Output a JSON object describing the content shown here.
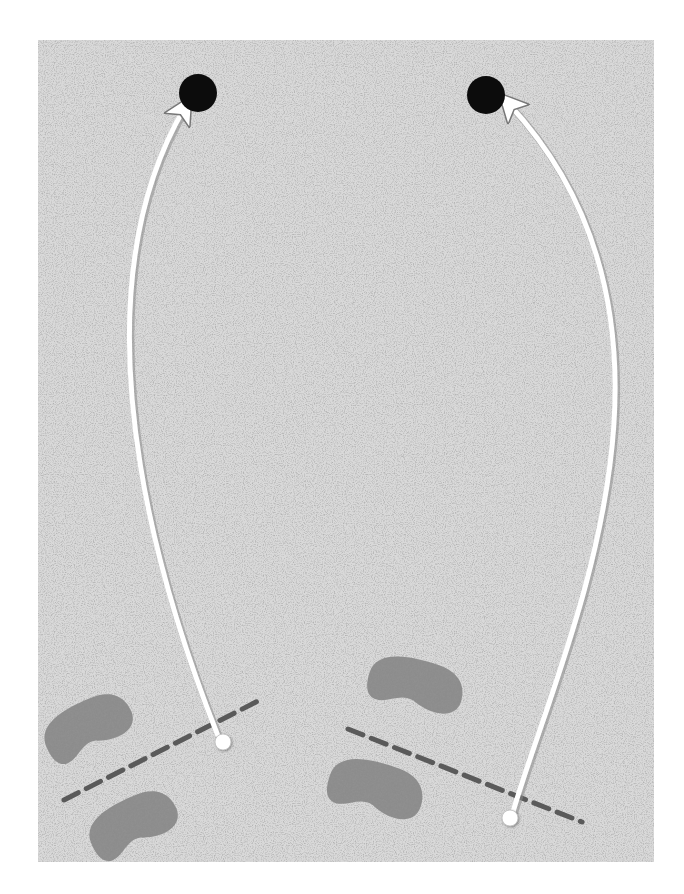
{
  "diagram": {
    "type": "golf-putting-illustration",
    "background": {
      "color": "#ffffff"
    },
    "green": {
      "x": 38,
      "y": 40,
      "width": 616,
      "height": 822,
      "base_color": "#d9d9d9",
      "speckle_color": "#8a8a8a",
      "texture": "sand-speckle"
    },
    "scenes": [
      {
        "id": "left",
        "hole": {
          "cx": 198,
          "cy": 93,
          "r": 19,
          "color": "#0c0c0c"
        },
        "ball": {
          "cx": 223,
          "cy": 742,
          "r": 8,
          "color": "#ffffff"
        },
        "path": {
          "d": "M 218 736 C 180 640, 60 320, 185 107",
          "color": "#ffffff",
          "width": 5,
          "arrowhead": "end"
        },
        "aim_line": {
          "x1": 64,
          "y1": 800,
          "x2": 262,
          "y2": 699,
          "color": "#5a5a5a",
          "dash": "16 9",
          "width": 5
        },
        "footprints": [
          {
            "cx": 88,
            "cy": 727,
            "rx": 46,
            "ry": 26,
            "rotate": -22,
            "color": "#8c8c8c"
          },
          {
            "cx": 133,
            "cy": 824,
            "rx": 46,
            "ry": 26,
            "rotate": -22,
            "color": "#8c8c8c"
          }
        ]
      },
      {
        "id": "right",
        "hole": {
          "cx": 486,
          "cy": 95,
          "r": 19,
          "color": "#0c0c0c"
        },
        "ball": {
          "cx": 510,
          "cy": 818,
          "r": 8,
          "color": "#ffffff"
        },
        "path": {
          "d": "M 513 812 C 560 650, 720 330, 508 103",
          "color": "#ffffff",
          "width": 5,
          "arrowhead": "end"
        },
        "aim_line": {
          "x1": 348,
          "y1": 729,
          "x2": 582,
          "y2": 822,
          "color": "#5a5a5a",
          "dash": "16 9",
          "width": 5
        },
        "footprints": [
          {
            "cx": 416,
            "cy": 685,
            "rx": 48,
            "ry": 26,
            "rotate": 18,
            "color": "#8c8c8c"
          },
          {
            "cx": 376,
            "cy": 789,
            "rx": 48,
            "ry": 27,
            "rotate": 20,
            "color": "#8c8c8c"
          }
        ]
      }
    ]
  }
}
